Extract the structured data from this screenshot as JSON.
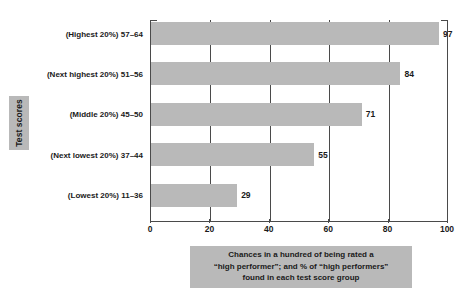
{
  "chart_data": {
    "type": "bar",
    "orientation": "horizontal",
    "title": "",
    "subtitle": "",
    "xlabel": "Chances in a hundred of being rated a “high performer”; and % of “high performers” found in each test score group",
    "ylabel": "Test scores",
    "xlim": [
      0,
      100
    ],
    "xticks": [
      0,
      20,
      40,
      60,
      80,
      100
    ],
    "grid": true,
    "grid_axis": "x",
    "legend": false,
    "categories": [
      "(Highest 20%) 57–64",
      "(Next highest 20%) 51–56",
      "(Middle 20%) 45–50",
      "(Next lowest 20%) 37–44",
      "(Lowest 20%) 11–36"
    ],
    "values": [
      97,
      84,
      71,
      55,
      29
    ],
    "value_labels": [
      "97",
      "84",
      "71",
      "55",
      "29"
    ],
    "bar_color": "#b9b9b9",
    "axis_color": "#4a4a4a",
    "text_color": "#1a1a1a",
    "accent_box_color": "#b9b9b9"
  },
  "axis": {
    "y_title": "Test scores",
    "x_tick_labels": [
      "0",
      "20",
      "40",
      "60",
      "80",
      "100"
    ]
  },
  "caption": {
    "line1": "Chances in a hundred of being rated a",
    "line2": "“high performer”; and % of “high performers”",
    "line3": "found in each test score group"
  }
}
